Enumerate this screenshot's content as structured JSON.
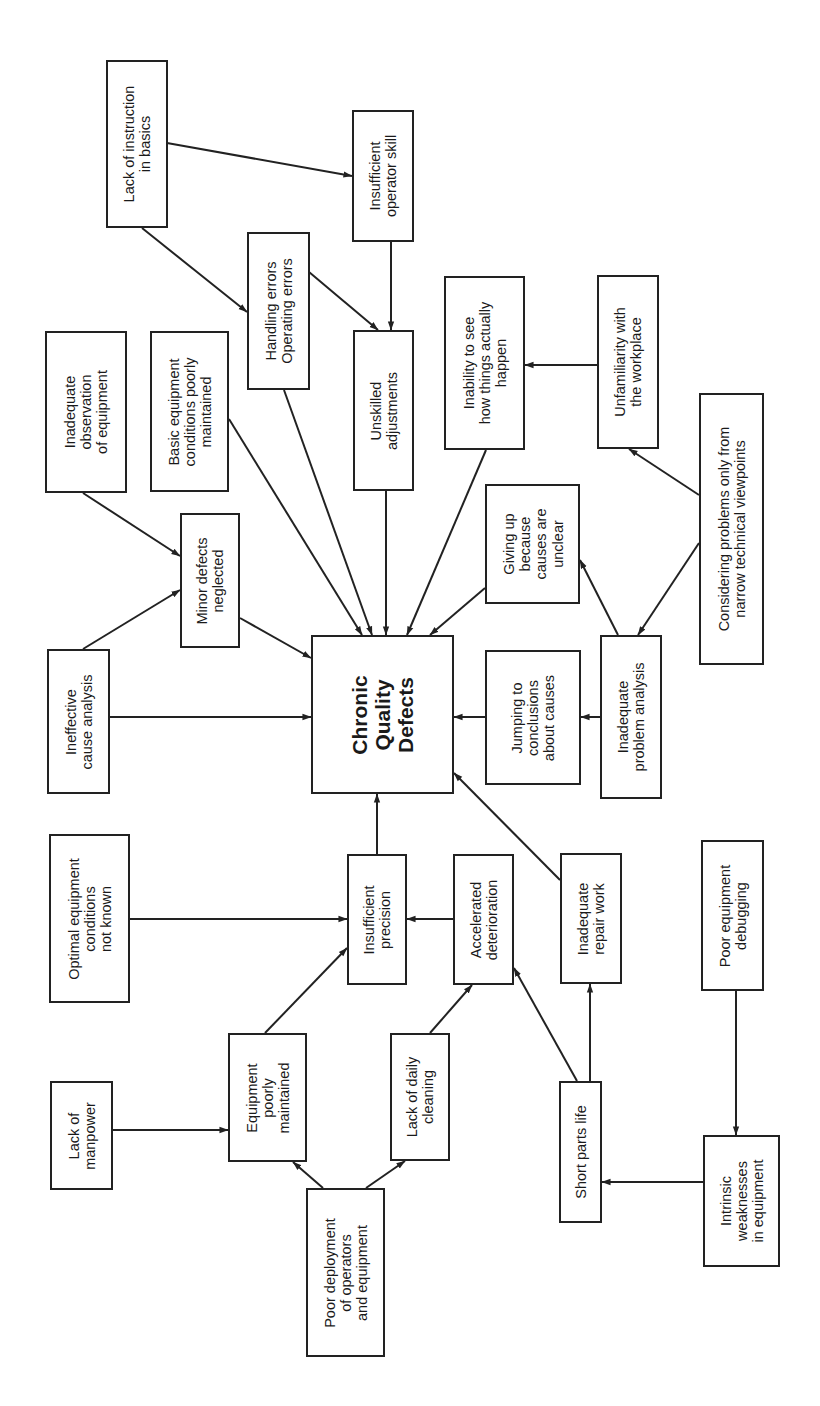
{
  "diagram": {
    "title": "Chronic Quality Defects",
    "orientation": "rotated-90-ccw",
    "colors": {
      "stroke": "#222222",
      "background": "#ffffff",
      "text": "#1a1a1a"
    },
    "nodes": [
      {
        "id": "chronic",
        "label": "Chronic\nQuality\nDefects",
        "x": 311,
        "y": 635,
        "w": 143,
        "h": 159,
        "central": true
      },
      {
        "id": "lack_instruction",
        "label": "Lack of instruction\nin basics",
        "x": 106,
        "y": 60,
        "w": 62,
        "h": 168
      },
      {
        "id": "insuff_skill",
        "label": "Insufficient\noperator skill",
        "x": 352,
        "y": 110,
        "w": 62,
        "h": 132
      },
      {
        "id": "handling",
        "label": "Handling errors\nOperating errors",
        "x": 247,
        "y": 232,
        "w": 63,
        "h": 158
      },
      {
        "id": "unskilled",
        "label": "Unskilled\nadjustments",
        "x": 353,
        "y": 330,
        "w": 61,
        "h": 161
      },
      {
        "id": "inadequate_obs",
        "label": "Inadequate\nobservation\nof equipment",
        "x": 45,
        "y": 331,
        "w": 82,
        "h": 162
      },
      {
        "id": "basic_equip",
        "label": "Basic equipment\nconditions poorly\nmaintained",
        "x": 150,
        "y": 331,
        "w": 79,
        "h": 161
      },
      {
        "id": "minor_defects",
        "label": "Minor defects\nneglected",
        "x": 180,
        "y": 513,
        "w": 60,
        "h": 135
      },
      {
        "id": "ineffective",
        "label": "Ineffective\ncause analysis",
        "x": 47,
        "y": 649,
        "w": 63,
        "h": 145
      },
      {
        "id": "inability",
        "label": "Inability to see\nhow things actually\nhappen",
        "x": 444,
        "y": 276,
        "w": 81,
        "h": 174
      },
      {
        "id": "unfamiliarity",
        "label": "Unfamiliarity with\nthe workplace",
        "x": 597,
        "y": 275,
        "w": 62,
        "h": 174
      },
      {
        "id": "considering",
        "label": "Considering problems only from\nnarrow technical viewpoints",
        "x": 699,
        "y": 393,
        "w": 65,
        "h": 272
      },
      {
        "id": "giving_up",
        "label": "Giving up\nbecause\ncauses are\nunclear",
        "x": 485,
        "y": 484,
        "w": 95,
        "h": 120
      },
      {
        "id": "jumping",
        "label": "Jumping to\nconclusions\nabout causes",
        "x": 485,
        "y": 650,
        "w": 96,
        "h": 135
      },
      {
        "id": "inadequate_problem",
        "label": "Inadequate\nproblem analysis",
        "x": 600,
        "y": 635,
        "w": 62,
        "h": 164
      },
      {
        "id": "optimal",
        "label": "Optimal equipment\nconditions\nnot known",
        "x": 49,
        "y": 834,
        "w": 81,
        "h": 169
      },
      {
        "id": "insuff_precision",
        "label": "Insufficient\nprecision",
        "x": 347,
        "y": 854,
        "w": 60,
        "h": 131
      },
      {
        "id": "accelerated",
        "label": "Accelerated\ndeterioration",
        "x": 453,
        "y": 854,
        "w": 61,
        "h": 131
      },
      {
        "id": "inadequate_repair",
        "label": "Inadequate\nrepair work",
        "x": 560,
        "y": 853,
        "w": 62,
        "h": 131
      },
      {
        "id": "poor_debugging",
        "label": "Poor equipment\ndebugging",
        "x": 701,
        "y": 840,
        "w": 63,
        "h": 151
      },
      {
        "id": "lack_manpower",
        "label": "Lack of\nmanpower",
        "x": 50,
        "y": 1081,
        "w": 63,
        "h": 109
      },
      {
        "id": "equip_poorly",
        "label": "Equipment\npoorly\nmaintained",
        "x": 228,
        "y": 1033,
        "w": 79,
        "h": 129
      },
      {
        "id": "lack_cleaning",
        "label": "Lack of daily\ncleaning",
        "x": 390,
        "y": 1033,
        "w": 60,
        "h": 128
      },
      {
        "id": "short_parts",
        "label": "Short parts life",
        "x": 559,
        "y": 1081,
        "w": 43,
        "h": 142
      },
      {
        "id": "intrinsic",
        "label": "Intrinsic\nweaknesses\nin equipment",
        "x": 703,
        "y": 1135,
        "w": 77,
        "h": 132
      },
      {
        "id": "poor_deployment",
        "label": "Poor deployment\nof operators\nand equipment",
        "x": 306,
        "y": 1188,
        "w": 79,
        "h": 169
      }
    ],
    "edges": [
      {
        "from": "lack_instruction",
        "to": "insuff_skill",
        "x1": 167,
        "y1": 143,
        "x2": 352,
        "y2": 176
      },
      {
        "from": "lack_instruction",
        "to": "handling",
        "x1": 142,
        "y1": 228,
        "x2": 247,
        "y2": 312
      },
      {
        "from": "handling",
        "to": "unskilled",
        "x1": 309,
        "y1": 272,
        "x2": 378,
        "y2": 330
      },
      {
        "from": "insuff_skill",
        "to": "unskilled",
        "x1": 391,
        "y1": 242,
        "x2": 391,
        "y2": 330
      },
      {
        "from": "inadequate_obs",
        "to": "minor_defects",
        "x1": 83,
        "y1": 493,
        "x2": 180,
        "y2": 556
      },
      {
        "from": "ineffective",
        "to": "minor_defects",
        "x1": 83,
        "y1": 649,
        "x2": 180,
        "y2": 590
      },
      {
        "from": "ineffective",
        "to": "chronic",
        "x1": 110,
        "y1": 717,
        "x2": 311,
        "y2": 717
      },
      {
        "from": "minor_defects",
        "to": "chronic",
        "x1": 240,
        "y1": 618,
        "x2": 311,
        "y2": 658
      },
      {
        "from": "basic_equip",
        "to": "chronic",
        "x1": 229,
        "y1": 419,
        "x2": 362,
        "y2": 635
      },
      {
        "from": "handling",
        "to": "chronic",
        "x1": 284,
        "y1": 390,
        "x2": 372,
        "y2": 635
      },
      {
        "from": "unskilled",
        "to": "chronic",
        "x1": 386,
        "y1": 491,
        "x2": 386,
        "y2": 635
      },
      {
        "from": "inability",
        "to": "chronic",
        "x1": 486,
        "y1": 450,
        "x2": 407,
        "y2": 635
      },
      {
        "from": "giving_up",
        "to": "chronic",
        "x1": 485,
        "y1": 588,
        "x2": 430,
        "y2": 635
      },
      {
        "from": "unfamiliarity",
        "to": "inability",
        "x1": 597,
        "y1": 365,
        "x2": 525,
        "y2": 365
      },
      {
        "from": "considering",
        "to": "unfamiliarity",
        "x1": 699,
        "y1": 495,
        "x2": 629,
        "y2": 449
      },
      {
        "from": "considering",
        "to": "inadequate_problem",
        "x1": 699,
        "y1": 543,
        "x2": 638,
        "y2": 635
      },
      {
        "from": "inadequate_problem",
        "to": "giving_up",
        "x1": 618,
        "y1": 635,
        "x2": 580,
        "y2": 560
      },
      {
        "from": "inadequate_problem",
        "to": "jumping",
        "x1": 600,
        "y1": 717,
        "x2": 581,
        "y2": 717
      },
      {
        "from": "jumping",
        "to": "chronic",
        "x1": 485,
        "y1": 717,
        "x2": 454,
        "y2": 717
      },
      {
        "from": "insuff_precision",
        "to": "chronic",
        "x1": 377,
        "y1": 854,
        "x2": 377,
        "y2": 794
      },
      {
        "from": "inadequate_repair",
        "to": "chronic",
        "x1": 560,
        "y1": 880,
        "x2": 454,
        "y2": 773
      },
      {
        "from": "optimal",
        "to": "insuff_precision",
        "x1": 130,
        "y1": 919,
        "x2": 347,
        "y2": 919
      },
      {
        "from": "accelerated",
        "to": "insuff_precision",
        "x1": 453,
        "y1": 919,
        "x2": 407,
        "y2": 919
      },
      {
        "from": "equip_poorly",
        "to": "insuff_precision",
        "x1": 265,
        "y1": 1033,
        "x2": 347,
        "y2": 948
      },
      {
        "from": "lack_cleaning",
        "to": "accelerated",
        "x1": 430,
        "y1": 1033,
        "x2": 472,
        "y2": 985
      },
      {
        "from": "short_parts",
        "to": "accelerated",
        "x1": 577,
        "y1": 1081,
        "x2": 514,
        "y2": 968
      },
      {
        "from": "short_parts",
        "to": "inadequate_repair",
        "x1": 590,
        "y1": 1081,
        "x2": 590,
        "y2": 984
      },
      {
        "from": "poor_debugging",
        "to": "intrinsic",
        "x1": 736,
        "y1": 991,
        "x2": 736,
        "y2": 1135
      },
      {
        "from": "intrinsic",
        "to": "short_parts",
        "x1": 703,
        "y1": 1182,
        "x2": 602,
        "y2": 1182
      },
      {
        "from": "lack_manpower",
        "to": "equip_poorly",
        "x1": 113,
        "y1": 1130,
        "x2": 228,
        "y2": 1130
      },
      {
        "from": "poor_deployment",
        "to": "equip_poorly",
        "x1": 323,
        "y1": 1188,
        "x2": 293,
        "y2": 1162
      },
      {
        "from": "poor_deployment",
        "to": "lack_cleaning",
        "x1": 366,
        "y1": 1188,
        "x2": 405,
        "y2": 1161
      }
    ]
  }
}
